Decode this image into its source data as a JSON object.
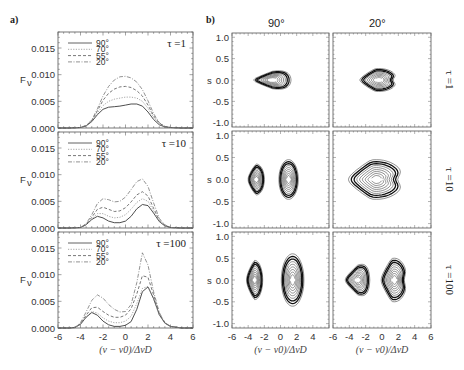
{
  "figure": {
    "panel_a_label": "a)",
    "panel_b_label": "b)",
    "column_headers": [
      "90°",
      "20°"
    ],
    "row_labels": [
      "τ =1",
      "τ =10",
      "τ =100"
    ],
    "left_ylabel": "F_ν",
    "right_ylabel": "s",
    "xlabel": "(ν − ν₀)/Δν_D"
  },
  "chart_data": [
    {
      "type": "line",
      "panel": "a",
      "title": "τ =1",
      "xlabel": "(ν − ν0)/ΔνD",
      "ylabel": "Fν",
      "xlim": [
        -6,
        6
      ],
      "ylim": [
        0,
        0.018
      ],
      "xticks": [
        -6,
        -4,
        -2,
        0,
        2,
        4,
        6
      ],
      "yticks": [
        0.0,
        0.005,
        0.01,
        0.015
      ],
      "ytick_labels": [
        "0.000",
        "0.005",
        "0.010",
        "0.015"
      ],
      "legend": [
        "90°",
        "70°",
        "55°",
        "20°"
      ],
      "x": [
        -6,
        -5,
        -4,
        -3.5,
        -3,
        -2.5,
        -2,
        -1.5,
        -1,
        -0.5,
        0,
        0.5,
        1,
        1.5,
        2,
        2.5,
        3,
        3.5,
        4,
        5,
        6
      ],
      "series": [
        {
          "name": "90°",
          "style": "solid",
          "values": [
            0,
            0,
            0.0001,
            0.0004,
            0.0012,
            0.0025,
            0.0035,
            0.0039,
            0.004,
            0.0041,
            0.0043,
            0.0045,
            0.0045,
            0.0041,
            0.003,
            0.0016,
            0.0006,
            0.0002,
            0.0001,
            0,
            0
          ]
        },
        {
          "name": "70°",
          "style": "dotted",
          "values": [
            0,
            0,
            0.0001,
            0.0004,
            0.0013,
            0.0028,
            0.0042,
            0.005,
            0.0054,
            0.0056,
            0.0058,
            0.0058,
            0.0056,
            0.005,
            0.0037,
            0.002,
            0.0008,
            0.0002,
            0.0001,
            0,
            0
          ]
        },
        {
          "name": "55°",
          "style": "dashed",
          "values": [
            0,
            0,
            0.0001,
            0.0004,
            0.0014,
            0.0032,
            0.0052,
            0.0065,
            0.0073,
            0.0077,
            0.0078,
            0.0076,
            0.007,
            0.006,
            0.0043,
            0.0023,
            0.0009,
            0.0003,
            0.0001,
            0,
            0
          ]
        },
        {
          "name": "20°",
          "style": "dashdot",
          "values": [
            0,
            0,
            0.0001,
            0.0005,
            0.0015,
            0.0036,
            0.006,
            0.0078,
            0.009,
            0.0096,
            0.0097,
            0.0094,
            0.0086,
            0.0072,
            0.0051,
            0.0027,
            0.001,
            0.0003,
            0.0001,
            0,
            0
          ]
        }
      ]
    },
    {
      "type": "line",
      "panel": "a",
      "title": "τ =10",
      "xlabel": "(ν − ν0)/ΔνD",
      "ylabel": "Fν",
      "xlim": [
        -6,
        6
      ],
      "ylim": [
        0,
        0.018
      ],
      "xticks": [
        -6,
        -4,
        -2,
        0,
        2,
        4,
        6
      ],
      "yticks": [
        0.0,
        0.005,
        0.01,
        0.015
      ],
      "ytick_labels": [
        "0.000",
        "0.005",
        "0.010",
        "0.015"
      ],
      "legend": [
        "90°",
        "70°",
        "55°",
        "20°"
      ],
      "x": [
        -6,
        -5,
        -4,
        -3.5,
        -3,
        -2.5,
        -2,
        -1.5,
        -1,
        -0.5,
        0,
        0.5,
        1,
        1.5,
        2,
        2.5,
        3,
        3.5,
        4,
        5,
        6
      ],
      "series": [
        {
          "name": "90°",
          "style": "solid",
          "values": [
            0,
            0,
            0.0001,
            0.0006,
            0.0016,
            0.0022,
            0.0019,
            0.0013,
            0.001,
            0.001,
            0.0013,
            0.0022,
            0.0036,
            0.0044,
            0.0042,
            0.0028,
            0.0012,
            0.0004,
            0.0001,
            0,
            0
          ]
        },
        {
          "name": "70°",
          "style": "dotted",
          "values": [
            0,
            0,
            0.0001,
            0.0006,
            0.0017,
            0.0027,
            0.0027,
            0.0022,
            0.0019,
            0.002,
            0.0025,
            0.0035,
            0.0048,
            0.0055,
            0.005,
            0.0032,
            0.0013,
            0.0004,
            0.0001,
            0,
            0
          ]
        },
        {
          "name": "55°",
          "style": "dashed",
          "values": [
            0,
            0,
            0.0001,
            0.0007,
            0.002,
            0.0035,
            0.0039,
            0.0035,
            0.0031,
            0.0032,
            0.0038,
            0.0049,
            0.0062,
            0.0068,
            0.006,
            0.0037,
            0.0015,
            0.0005,
            0.0001,
            0,
            0
          ]
        },
        {
          "name": "20°",
          "style": "dashdot",
          "values": [
            0,
            0,
            0.0001,
            0.0008,
            0.0025,
            0.0046,
            0.0055,
            0.0053,
            0.0049,
            0.005,
            0.0058,
            0.0072,
            0.0087,
            0.0092,
            0.0078,
            0.0047,
            0.0018,
            0.0006,
            0.0001,
            0,
            0
          ]
        }
      ]
    },
    {
      "type": "line",
      "panel": "a",
      "title": "τ =100",
      "xlabel": "(ν − ν0)/ΔνD",
      "ylabel": "Fν",
      "xlim": [
        -6,
        6
      ],
      "ylim": [
        0,
        0.018
      ],
      "xticks": [
        -6,
        -4,
        -2,
        0,
        2,
        4,
        6
      ],
      "yticks": [
        0.0,
        0.005,
        0.01,
        0.015
      ],
      "ytick_labels": [
        "0.000",
        "0.005",
        "0.010",
        "0.015"
      ],
      "legend": [
        "90°",
        "70°",
        "55°",
        "20°"
      ],
      "x": [
        -6,
        -5,
        -4.5,
        -4,
        -3.5,
        -3,
        -2.5,
        -2,
        -1.5,
        -1,
        -0.5,
        0,
        0.5,
        1,
        1.5,
        2,
        2.5,
        3,
        3.5,
        4,
        5,
        6
      ],
      "series": [
        {
          "name": "90°",
          "style": "solid",
          "values": [
            0,
            0,
            0.0001,
            0.0007,
            0.002,
            0.0029,
            0.0024,
            0.0013,
            0.0006,
            0.0003,
            0.0003,
            0.0005,
            0.0012,
            0.0035,
            0.0068,
            0.0077,
            0.0055,
            0.0025,
            0.0009,
            0.0003,
            0,
            0
          ]
        },
        {
          "name": "70°",
          "style": "dotted",
          "values": [
            0,
            0,
            0.0001,
            0.0007,
            0.0021,
            0.0031,
            0.0028,
            0.0019,
            0.0013,
            0.001,
            0.001,
            0.0013,
            0.0022,
            0.0046,
            0.0074,
            0.0078,
            0.0054,
            0.0024,
            0.0009,
            0.0003,
            0,
            0
          ]
        },
        {
          "name": "55°",
          "style": "dashed",
          "values": [
            0,
            0,
            0.0001,
            0.0008,
            0.0024,
            0.0038,
            0.0039,
            0.0031,
            0.0024,
            0.002,
            0.002,
            0.0024,
            0.0036,
            0.0064,
            0.0098,
            0.0095,
            0.0062,
            0.0027,
            0.001,
            0.0003,
            0,
            0
          ]
        },
        {
          "name": "20°",
          "style": "dashdot",
          "values": [
            0,
            0,
            0.0001,
            0.001,
            0.003,
            0.0052,
            0.0062,
            0.0056,
            0.0044,
            0.0035,
            0.003,
            0.0031,
            0.0044,
            0.0085,
            0.0141,
            0.0118,
            0.0068,
            0.0029,
            0.001,
            0.0003,
            0,
            0
          ]
        }
      ]
    },
    {
      "type": "contour",
      "panel": "b",
      "grid": [
        {
          "row": "τ =1",
          "col": "90°",
          "lobes": [
            {
              "cx": -1.0,
              "cy": 0.0,
              "rx": 2.3,
              "ry": 0.27,
              "shape": "rounded-triangle"
            }
          ]
        },
        {
          "row": "τ =1",
          "col": "20°",
          "lobes": [
            {
              "cx": -0.4,
              "cy": 0.0,
              "rx": 2.3,
              "ry": 0.27,
              "shape": "heart"
            }
          ]
        },
        {
          "row": "τ =10",
          "col": "90°",
          "lobes": [
            {
              "cx": -3.0,
              "cy": 0.0,
              "rx": 1.0,
              "ry": 0.35,
              "shape": "half-oval"
            },
            {
              "cx": 1.0,
              "cy": 0.0,
              "rx": 1.2,
              "ry": 0.45,
              "shape": "oval"
            }
          ]
        },
        {
          "row": "τ =10",
          "col": "20°",
          "lobes": [
            {
              "cx": -0.7,
              "cy": 0.0,
              "rx": 3.4,
              "ry": 0.45,
              "shape": "heart-wide"
            }
          ]
        },
        {
          "row": "τ =100",
          "col": "90°",
          "lobes": [
            {
              "cx": -3.2,
              "cy": 0.0,
              "rx": 1.0,
              "ry": 0.45,
              "shape": "half-oval"
            },
            {
              "cx": 1.5,
              "cy": 0.0,
              "rx": 1.4,
              "ry": 0.6,
              "shape": "oval"
            }
          ]
        },
        {
          "row": "τ =100",
          "col": "20°",
          "lobes": [
            {
              "cx": -3.0,
              "cy": 0.0,
              "rx": 1.5,
              "ry": 0.45,
              "shape": "triangle"
            },
            {
              "cx": 1.5,
              "cy": 0.0,
              "rx": 1.6,
              "ry": 0.5,
              "shape": "heart"
            }
          ]
        }
      ],
      "xlabel": "(ν − ν0)/ΔνD",
      "ylabel": "s",
      "xlim": [
        -6,
        6
      ],
      "ylim": [
        -1.1,
        1.1
      ],
      "xticks_col1": [
        -6,
        -4,
        -2,
        0,
        2,
        4
      ],
      "xticks_col2": [
        -6,
        -4,
        -2,
        0,
        2,
        4,
        6
      ],
      "yticks": [
        -1.0,
        -0.5,
        0.0,
        0.5,
        1.0
      ],
      "ytick_labels": [
        "-1.0",
        "-0.5",
        "0.0",
        "0.5",
        "1.0"
      ]
    }
  ]
}
